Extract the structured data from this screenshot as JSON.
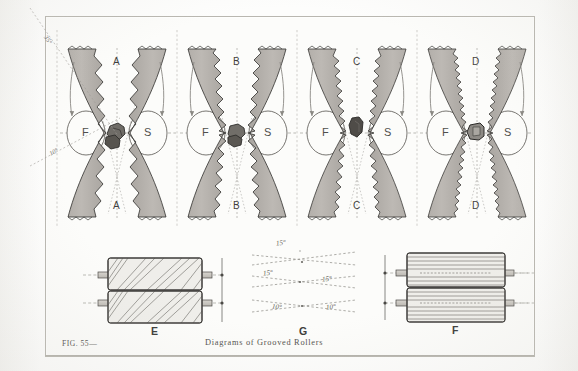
{
  "figure": {
    "number_label": "FIG. 55—",
    "caption": "Diagrams of Grooved Rollers",
    "colors": {
      "roller_fill": "#b6b2ad",
      "roller_outline": "#3a3936",
      "paper": "#fcfcfa",
      "frame": "#b9b7b0",
      "dashed_guide": "#8d8b85",
      "material_dark": "#4a4845",
      "text": "#4a4a48"
    }
  },
  "top_row": {
    "description": "Four pairs of opposed concave grooved crushing rollers shown in axial section; each pair has a feed roller F and a second roller S with a piece of material gripped at the nip.",
    "pairs": [
      {
        "letter": "A",
        "top_letter": "A",
        "bottom_letter": "A",
        "left_roller": "F",
        "right_roller": "S",
        "groove_count": 7,
        "groove_style": "coarse-sawtooth"
      },
      {
        "letter": "B",
        "top_letter": "B",
        "bottom_letter": "B",
        "left_roller": "F",
        "right_roller": "S",
        "groove_count": 9,
        "groove_style": "medium-sawtooth"
      },
      {
        "letter": "C",
        "top_letter": "C",
        "bottom_letter": "C",
        "left_roller": "F",
        "right_roller": "S",
        "groove_count": 11,
        "groove_style": "fine-sawtooth"
      },
      {
        "letter": "D",
        "top_letter": "D",
        "bottom_letter": "D",
        "left_roller": "F",
        "right_roller": "S",
        "groove_count": 13,
        "groove_style": "very-fine-sawtooth"
      }
    ]
  },
  "angle_guides": {
    "upper_left": "35°",
    "lower_left": "10°"
  },
  "bottom_row": {
    "roller_E": {
      "letter": "E",
      "groove_type": "helical",
      "groove_count": 11,
      "rollers": 2
    },
    "roller_F": {
      "letter": "F",
      "groove_type": "circumferential",
      "groove_count": 9,
      "rollers": 2
    },
    "diagram_G": {
      "letter": "G",
      "angles": [
        "15°",
        "15°",
        "15°",
        "10°",
        "10°"
      ],
      "angle_top": "15°",
      "angle_mid_left": "15°",
      "angle_mid_right": "15°",
      "angle_low_left": "10°",
      "angle_low_right": "10°"
    }
  }
}
